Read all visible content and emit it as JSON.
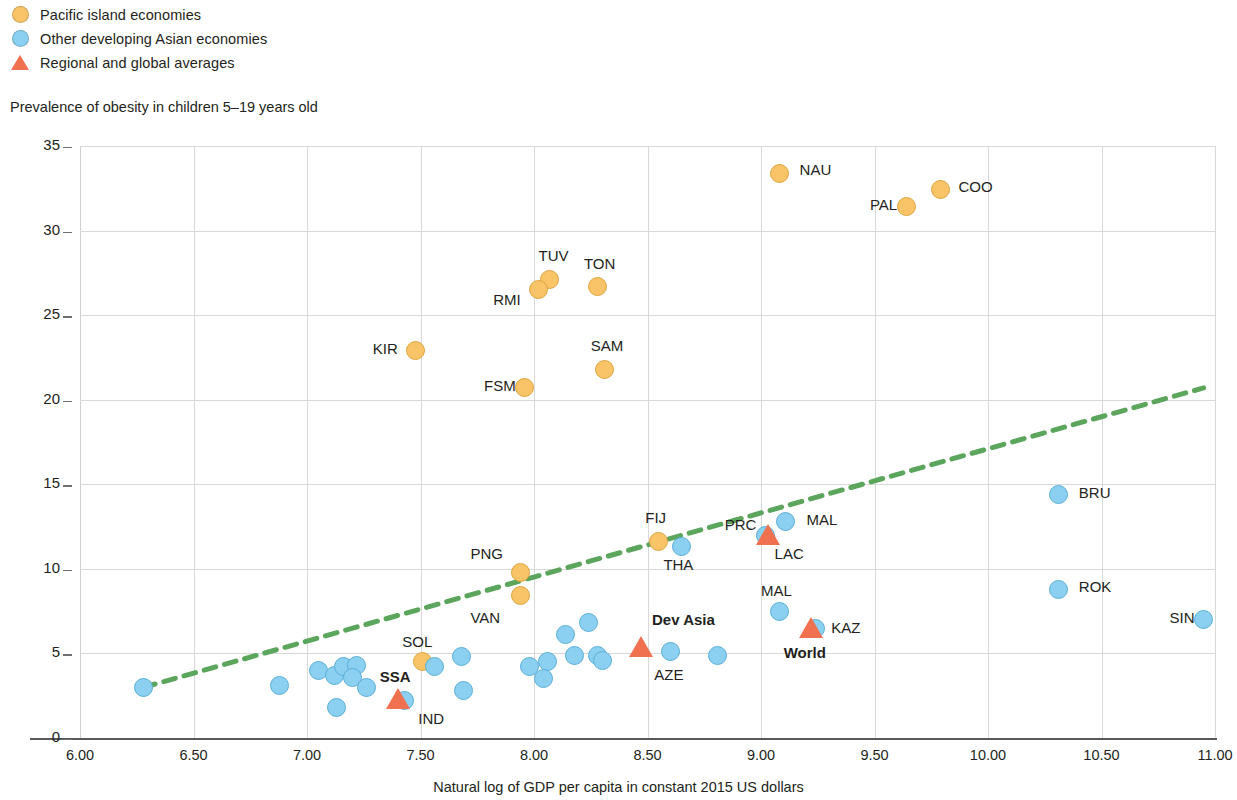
{
  "legend": {
    "items": [
      {
        "label": "Pacific island economies",
        "marker": "circle",
        "color": "#f9c468",
        "name": "legend-pacific-island"
      },
      {
        "label": "Other developing Asian economies",
        "marker": "circle",
        "color": "#8bd0f0",
        "name": "legend-other-asian"
      },
      {
        "label": "Regional and global averages",
        "marker": "triangle",
        "color": "#f0714f",
        "name": "legend-averages"
      }
    ]
  },
  "chart_data": {
    "type": "scatter",
    "title": "",
    "ylabel": "Prevalence of obesity in children 5–19 years old",
    "xlabel": "Natural log of GDP per capita in constant 2015 US dollars",
    "xlim": [
      6.0,
      11.0
    ],
    "ylim": [
      0,
      35
    ],
    "xticks": [
      "6.00",
      "6.50",
      "7.00",
      "7.50",
      "8.00",
      "8.50",
      "9.00",
      "9.50",
      "10.00",
      "10.50",
      "11.00"
    ],
    "yticks": [
      "0",
      "5",
      "10",
      "15",
      "20",
      "25",
      "30",
      "35"
    ],
    "grid": true,
    "legend_position": "top-left",
    "trendline": {
      "style": "dashed",
      "color": "#5ca55c",
      "x0": 6.28,
      "y0": 3.0,
      "x1": 10.95,
      "y1": 20.7
    },
    "series": [
      {
        "name": "Pacific island economies",
        "color": "#f9c468",
        "marker": "circle",
        "points": [
          {
            "code": "NAU",
            "x": 9.08,
            "y": 33.4,
            "label_pos": "right"
          },
          {
            "code": "COO",
            "x": 9.79,
            "y": 32.4,
            "label_pos": "right"
          },
          {
            "code": "PAL",
            "x": 9.64,
            "y": 31.4,
            "label_pos": "left"
          },
          {
            "code": "TUV",
            "x": 8.07,
            "y": 27.1,
            "label_pos": "above"
          },
          {
            "code": "RMI",
            "x": 8.02,
            "y": 26.5,
            "label_pos": "left"
          },
          {
            "code": "TON",
            "x": 8.28,
            "y": 26.7,
            "label_pos": "above"
          },
          {
            "code": "KIR",
            "x": 7.48,
            "y": 22.9,
            "label_pos": "left"
          },
          {
            "code": "SAM",
            "x": 8.31,
            "y": 21.8,
            "label_pos": "above"
          },
          {
            "code": "FSM",
            "x": 7.96,
            "y": 20.7,
            "label_pos": "left"
          },
          {
            "code": "FIJ",
            "x": 8.55,
            "y": 11.6,
            "label_pos": "above"
          },
          {
            "code": "PNG",
            "x": 7.94,
            "y": 9.8,
            "label_pos": "left"
          },
          {
            "code": "VAN",
            "x": 7.94,
            "y": 8.4,
            "label_pos": "below-left"
          },
          {
            "code": "SOL",
            "x": 7.51,
            "y": 4.5,
            "label_pos": "above"
          }
        ]
      },
      {
        "name": "Other developing Asian economies",
        "color": "#8bd0f0",
        "marker": "circle",
        "points": [
          {
            "code": "BRU",
            "x": 10.31,
            "y": 14.4,
            "label_pos": "right"
          },
          {
            "code": "MAL",
            "x": 9.11,
            "y": 12.8,
            "label_pos": "right"
          },
          {
            "code": "PRC",
            "x": 9.02,
            "y": 12.0,
            "label_pos": "left"
          },
          {
            "code": "THA",
            "x": 8.65,
            "y": 11.3,
            "label_pos": "below"
          },
          {
            "code": "ROK",
            "x": 10.31,
            "y": 8.8,
            "label_pos": "right"
          },
          {
            "code": "MAL",
            "x": 9.08,
            "y": 7.5,
            "label_pos": "above"
          },
          {
            "code": "SIN",
            "x": 10.95,
            "y": 7.0,
            "label_pos": "left"
          },
          {
            "code": "KAZ",
            "x": 9.24,
            "y": 6.5,
            "label_pos": "right"
          },
          {
            "code": "AZE",
            "x": 8.6,
            "y": 5.1,
            "label_pos": "below"
          },
          {
            "code": "IND",
            "x": 7.43,
            "y": 2.2,
            "label_pos": "below-right"
          },
          {
            "code": "",
            "x": 6.28,
            "y": 3.0,
            "label_pos": "none"
          },
          {
            "code": "",
            "x": 6.88,
            "y": 3.1,
            "label_pos": "none"
          },
          {
            "code": "",
            "x": 7.05,
            "y": 4.0,
            "label_pos": "none"
          },
          {
            "code": "",
            "x": 7.12,
            "y": 3.7,
            "label_pos": "none"
          },
          {
            "code": "",
            "x": 7.16,
            "y": 4.2,
            "label_pos": "none"
          },
          {
            "code": "",
            "x": 7.22,
            "y": 4.3,
            "label_pos": "none"
          },
          {
            "code": "",
            "x": 7.2,
            "y": 3.6,
            "label_pos": "none"
          },
          {
            "code": "",
            "x": 7.13,
            "y": 1.8,
            "label_pos": "none"
          },
          {
            "code": "",
            "x": 7.26,
            "y": 3.0,
            "label_pos": "none"
          },
          {
            "code": "",
            "x": 7.56,
            "y": 4.2,
            "label_pos": "none"
          },
          {
            "code": "",
            "x": 7.68,
            "y": 4.8,
            "label_pos": "none"
          },
          {
            "code": "",
            "x": 7.69,
            "y": 2.8,
            "label_pos": "none"
          },
          {
            "code": "",
            "x": 7.98,
            "y": 4.2,
            "label_pos": "none"
          },
          {
            "code": "",
            "x": 8.06,
            "y": 4.5,
            "label_pos": "none"
          },
          {
            "code": "",
            "x": 8.04,
            "y": 3.5,
            "label_pos": "none"
          },
          {
            "code": "",
            "x": 8.14,
            "y": 6.1,
            "label_pos": "none"
          },
          {
            "code": "",
            "x": 8.18,
            "y": 4.9,
            "label_pos": "none"
          },
          {
            "code": "",
            "x": 8.24,
            "y": 6.8,
            "label_pos": "none"
          },
          {
            "code": "",
            "x": 8.28,
            "y": 4.9,
            "label_pos": "none"
          },
          {
            "code": "",
            "x": 8.3,
            "y": 4.6,
            "label_pos": "none"
          },
          {
            "code": "",
            "x": 8.81,
            "y": 4.9,
            "label_pos": "none"
          }
        ]
      },
      {
        "name": "Regional and global averages",
        "color": "#f0714f",
        "marker": "triangle",
        "points": [
          {
            "code": "LAC",
            "x": 9.03,
            "y": 12.0,
            "label_pos": "below-right"
          },
          {
            "code": "KAZ-avg",
            "x": 9.22,
            "y": 6.5,
            "label_pos": "none"
          },
          {
            "code": "World",
            "x": 9.22,
            "y": 6.5,
            "label_pos": "below"
          },
          {
            "code": "Dev Asia",
            "x": 8.47,
            "y": 5.4,
            "label_pos": "above"
          },
          {
            "code": "SSA",
            "x": 7.4,
            "y": 2.3,
            "label_pos": "above"
          }
        ]
      }
    ],
    "annotations": [
      {
        "text": "NAU",
        "x": 9.17,
        "y": 33.6
      },
      {
        "text": "COO",
        "x": 9.87,
        "y": 32.6
      },
      {
        "text": "PAL",
        "x": 9.48,
        "y": 31.5
      },
      {
        "text": "TUV",
        "x": 8.02,
        "y": 28.5
      },
      {
        "text": "TON",
        "x": 8.22,
        "y": 28.0
      },
      {
        "text": "RMI",
        "x": 7.82,
        "y": 25.9
      },
      {
        "text": "KIR",
        "x": 7.29,
        "y": 23.0
      },
      {
        "text": "SAM",
        "x": 8.25,
        "y": 23.2
      },
      {
        "text": "FSM",
        "x": 7.78,
        "y": 20.8
      },
      {
        "text": "BRU",
        "x": 10.4,
        "y": 14.5
      },
      {
        "text": "MAL",
        "x": 9.2,
        "y": 12.9
      },
      {
        "text": "FIJ",
        "x": 8.49,
        "y": 13.0
      },
      {
        "text": "PRC",
        "x": 8.84,
        "y": 12.6
      },
      {
        "text": "LAC",
        "x": 9.06,
        "y": 10.9
      },
      {
        "text": "THA",
        "x": 8.57,
        "y": 10.2
      },
      {
        "text": "PNG",
        "x": 7.72,
        "y": 10.9
      },
      {
        "text": "ROK",
        "x": 10.4,
        "y": 8.9
      },
      {
        "text": "MAL",
        "x": 9.0,
        "y": 8.7
      },
      {
        "text": "VAN",
        "x": 7.72,
        "y": 7.1
      },
      {
        "text": "SIN",
        "x": 10.8,
        "y": 7.1
      },
      {
        "text": "KAZ",
        "x": 9.31,
        "y": 6.5
      },
      {
        "text": "Dev Asia",
        "x": 8.52,
        "y": 7.0,
        "bold": true
      },
      {
        "text": "World",
        "x": 9.1,
        "y": 5.0,
        "bold": true
      },
      {
        "text": "SOL",
        "x": 7.42,
        "y": 5.7
      },
      {
        "text": "AZE",
        "x": 8.53,
        "y": 3.7
      },
      {
        "text": "SSA",
        "x": 7.32,
        "y": 3.6,
        "bold": true
      },
      {
        "text": "IND",
        "x": 7.49,
        "y": 1.1
      }
    ]
  }
}
